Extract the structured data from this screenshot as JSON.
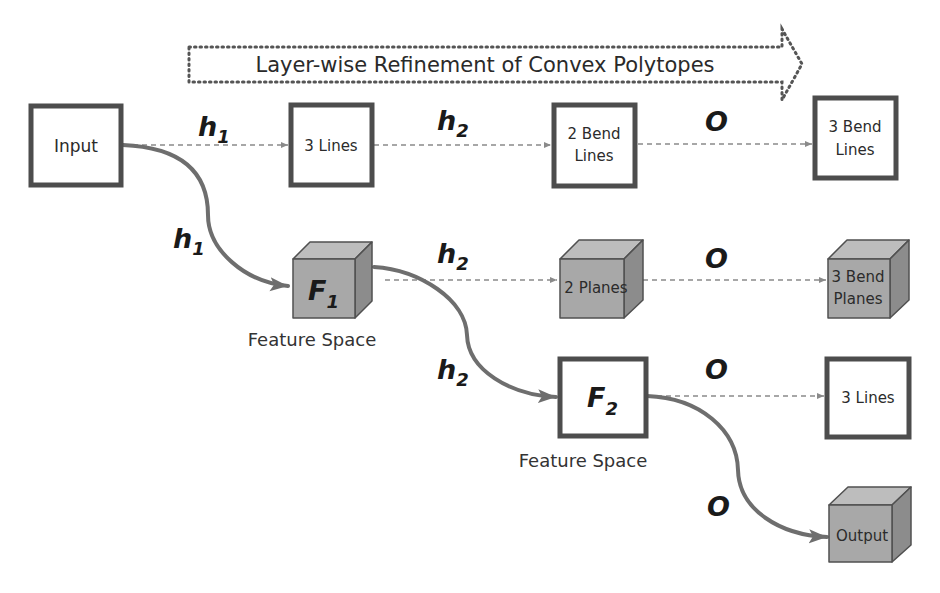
{
  "banner": {
    "label": "Layer-wise Refinement of Convex Polytopes"
  },
  "colors": {
    "box_border": "#4d4d4d",
    "cube_front": "#a8a8a8",
    "cube_top": "#bdbdbd",
    "cube_side": "#8c8c8c",
    "solid_arrow": "#6e6e6e",
    "dashed_arrow": "#8a8a8a",
    "banner_dots": "#555555"
  },
  "nodes": {
    "input": {
      "label": "Input"
    },
    "row1_h1": {
      "label": "3 Lines"
    },
    "row1_h2": {
      "line1": "2 Bend",
      "line2": "Lines"
    },
    "row1_o": {
      "line1": "3 Bend",
      "line2": "Lines"
    },
    "f1": {
      "main": "F",
      "sub": "1",
      "caption": "Feature Space"
    },
    "row2_h2": {
      "label": "2 Planes"
    },
    "row2_o": {
      "line1": "3 Bend",
      "line2": "Planes"
    },
    "f2": {
      "main": "F",
      "sub": "2",
      "caption": "Feature Space"
    },
    "row3_o": {
      "label": "3 Lines"
    },
    "output": {
      "label": "Output"
    }
  },
  "edge_labels": {
    "row1_h1": {
      "main": "h",
      "sub": "1"
    },
    "row1_h2": {
      "main": "h",
      "sub": "2"
    },
    "row1_o": {
      "main": "O"
    },
    "curve_h1": {
      "main": "h",
      "sub": "1"
    },
    "row2_h2": {
      "main": "h",
      "sub": "2"
    },
    "row2_o": {
      "main": "O"
    },
    "curve_h2": {
      "main": "h",
      "sub": "2"
    },
    "row3_o": {
      "main": "O"
    },
    "curve_o": {
      "main": "O"
    }
  }
}
